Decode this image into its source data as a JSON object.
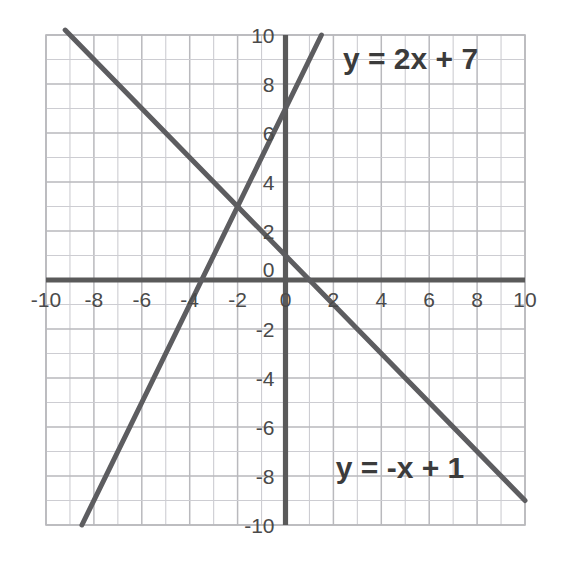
{
  "chart_data": {
    "type": "line",
    "title": "",
    "xlabel": "",
    "ylabel": "",
    "xlim": [
      -10,
      10
    ],
    "ylim": [
      -10,
      10
    ],
    "grid": true,
    "grid_step": 1,
    "tick_step": 2,
    "legend": "inline-annotations",
    "background": "#ffffff",
    "grid_color": "#b9b9bd",
    "minor_grid_color": "#cdcdd2",
    "axis_color": "#5a5a5a",
    "line_color": "#5d5d60",
    "label_color": "#3b3b3b",
    "tick_color": "#4a4a4a",
    "xticks": [
      -10,
      -8,
      -6,
      -4,
      -2,
      0,
      2,
      4,
      6,
      8,
      10
    ],
    "xtick_labels": [
      "-10",
      "-8",
      "-6",
      "-4",
      "-2",
      "0",
      "2",
      "4",
      "6",
      "8",
      "10"
    ],
    "yticks": [
      10,
      8,
      6,
      4,
      2,
      0,
      -2,
      -4,
      -6,
      -8,
      -10
    ],
    "ytick_labels": [
      "10",
      "8",
      "6",
      "4",
      "2",
      "0",
      "-2",
      "-4",
      "-6",
      "-8",
      "-10"
    ],
    "series": [
      {
        "name": "y = 2x + 7",
        "equation": "y = 2x + 7",
        "slope": 2,
        "intercept": 7,
        "x_intercept": -3.5,
        "y_intercept": 7,
        "points": [
          [
            -8.5,
            -10
          ],
          [
            1.5,
            10
          ]
        ],
        "color": "#5d5d60",
        "label": "y = 2x + 7",
        "label_x": 2.4,
        "label_y": 8.6
      },
      {
        "name": "y = -x + 1",
        "equation": "y = -x + 1",
        "slope": -1,
        "intercept": 1,
        "x_intercept": 1,
        "y_intercept": 1,
        "points": [
          [
            -9.2,
            10.2
          ],
          [
            10,
            -9
          ]
        ],
        "color": "#5d5d60",
        "label": "y = -x + 1",
        "label_x": 2.1,
        "label_y": -8.1
      }
    ],
    "intersection": {
      "x": -2,
      "y": 3,
      "label": "(-2, 3)"
    },
    "annotations": [
      {
        "text": "y = 2x + 7",
        "x": 2.4,
        "y": 8.6
      },
      {
        "text": "y = -x + 1",
        "x": 2.1,
        "y": -8.1
      }
    ]
  },
  "labels": {
    "equation_1": "y = 2x + 7",
    "equation_2": "y = -x + 1"
  },
  "axis": {
    "x_ticks": [
      "-10",
      "-8",
      "-6",
      "-4",
      "-2",
      "0",
      "2",
      "4",
      "6",
      "8",
      "10"
    ],
    "y_ticks": [
      "10",
      "8",
      "6",
      "4",
      "2",
      "0",
      "-2",
      "-4",
      "-6",
      "-8",
      "-10"
    ]
  }
}
